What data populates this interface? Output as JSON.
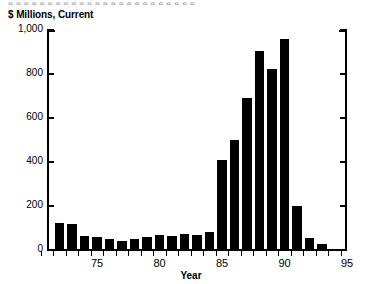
{
  "figure": {
    "top_remnant_text": "e e e e e e e e e e e e e e e e e e e e e e e e",
    "y_axis_title": "$ Millions, Current",
    "x_axis_title": "Year"
  },
  "chart_data": {
    "type": "bar",
    "title": "",
    "subtitle": "",
    "xlabel": "Year",
    "ylabel": "$ Millions, Current",
    "x": [
      72,
      73,
      74,
      75,
      76,
      77,
      78,
      79,
      80,
      81,
      82,
      83,
      84,
      85,
      86,
      87,
      88,
      89,
      90,
      91,
      92,
      93
    ],
    "categories": [
      "72",
      "73",
      "74",
      "75",
      "76",
      "77",
      "78",
      "79",
      "80",
      "81",
      "82",
      "83",
      "84",
      "85",
      "86",
      "87",
      "88",
      "89",
      "90",
      "91",
      "92",
      "93"
    ],
    "values": [
      125,
      120,
      62,
      57,
      48,
      42,
      52,
      58,
      67,
      62,
      72,
      67,
      83,
      410,
      500,
      690,
      905,
      822,
      960,
      200,
      55,
      28
    ],
    "xlim": [
      71,
      95
    ],
    "ylim": [
      0,
      1000
    ],
    "xticks": [
      75,
      80,
      85,
      90,
      95
    ],
    "xticklabels": [
      "75",
      "80",
      "85",
      "90",
      "95"
    ],
    "yticks": [
      0,
      200,
      400,
      600,
      800,
      1000
    ],
    "yticklabels": [
      "0",
      "200",
      "400",
      "600",
      "800",
      "1,000"
    ],
    "minor_xticks_every": 1,
    "grid": false,
    "legend": null,
    "bar_color": "#000000",
    "background_color": "#ffffff",
    "axes": {
      "left_spine": true,
      "right_spine": true,
      "bottom_spine": true,
      "top_spine": false,
      "right_tick_labels": false
    }
  }
}
